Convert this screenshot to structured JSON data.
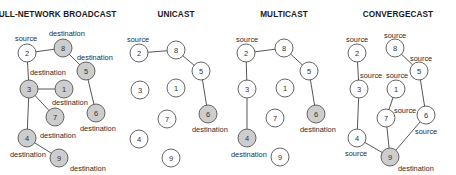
{
  "colors": {
    "node_fill": "#ffffff",
    "node_fill_highlight": "#cdcdcd",
    "node_stroke": "#555555",
    "edge": "#444444"
  },
  "panels": [
    {
      "title": "FULL-NETWORK BROADCAST",
      "title_x": 55,
      "nodes": [
        {
          "id": "2",
          "x": 27,
          "y": 53,
          "highlight": false,
          "label": "source",
          "lx": 15,
          "ly": 41
        },
        {
          "id": "8",
          "x": 63,
          "y": 48,
          "highlight": true,
          "label": "destination",
          "lx": 49,
          "ly": 36
        },
        {
          "id": "5",
          "x": 86,
          "y": 71,
          "highlight": true,
          "label": "destination",
          "lx": 77,
          "ly": 60
        },
        {
          "id": "3",
          "x": 29,
          "y": 89,
          "highlight": true,
          "label": "destination",
          "lx": 30,
          "ly": 75
        },
        {
          "id": "1",
          "x": 64,
          "y": 89,
          "highlight": true,
          "label": "destination",
          "lx": 52,
          "ly": 105
        },
        {
          "id": "7",
          "x": 55,
          "y": 117,
          "highlight": true,
          "label": "destination",
          "lx": 40,
          "ly": 138
        },
        {
          "id": "6",
          "x": 96,
          "y": 113,
          "highlight": true,
          "label": "destination",
          "lx": 80,
          "ly": 131
        },
        {
          "id": "4",
          "x": 27,
          "y": 138,
          "highlight": true,
          "label": "destination",
          "lx": 10,
          "ly": 157
        },
        {
          "id": "9",
          "x": 59,
          "y": 158,
          "highlight": true,
          "label": "destination",
          "lx": 70,
          "ly": 171
        }
      ],
      "edges": [
        [
          "2",
          "8"
        ],
        [
          "8",
          "5"
        ],
        [
          "5",
          "6"
        ],
        [
          "2",
          "3"
        ],
        [
          "3",
          "1"
        ],
        [
          "3",
          "7"
        ],
        [
          "3",
          "4"
        ],
        [
          "4",
          "9"
        ]
      ]
    },
    {
      "title": "UNICAST",
      "title_x": 176,
      "nodes": [
        {
          "id": "2",
          "x": 139,
          "y": 53,
          "highlight": false,
          "label": "source",
          "lx": 127,
          "ly": 42
        },
        {
          "id": "8",
          "x": 176,
          "y": 50,
          "highlight": false,
          "label": "",
          "lx": 0,
          "ly": 0
        },
        {
          "id": "5",
          "x": 201,
          "y": 71,
          "highlight": false,
          "label": "",
          "lx": 0,
          "ly": 0
        },
        {
          "id": "3",
          "x": 140,
          "y": 90,
          "highlight": false,
          "label": "",
          "lx": 0,
          "ly": 0
        },
        {
          "id": "1",
          "x": 176,
          "y": 88,
          "highlight": false,
          "label": "",
          "lx": 0,
          "ly": 0
        },
        {
          "id": "7",
          "x": 167,
          "y": 119,
          "highlight": false,
          "label": "",
          "lx": 0,
          "ly": 0
        },
        {
          "id": "6",
          "x": 208,
          "y": 114,
          "highlight": true,
          "label": "destination",
          "lx": 192,
          "ly": 132
        },
        {
          "id": "4",
          "x": 139,
          "y": 139,
          "highlight": false,
          "label": "",
          "lx": 0,
          "ly": 0
        },
        {
          "id": "9",
          "x": 171,
          "y": 158,
          "highlight": false,
          "label": "",
          "lx": 0,
          "ly": 0
        }
      ],
      "edges": [
        [
          "2",
          "8"
        ],
        [
          "8",
          "5"
        ],
        [
          "5",
          "6"
        ]
      ]
    },
    {
      "title": "MULTICAST",
      "title_x": 284,
      "nodes": [
        {
          "id": "2",
          "x": 246,
          "y": 53,
          "highlight": false,
          "label": "source",
          "lx": 236,
          "ly": 42
        },
        {
          "id": "8",
          "x": 284,
          "y": 48,
          "highlight": false,
          "label": "",
          "lx": 0,
          "ly": 0
        },
        {
          "id": "5",
          "x": 309,
          "y": 71,
          "highlight": false,
          "label": "",
          "lx": 0,
          "ly": 0
        },
        {
          "id": "3",
          "x": 247,
          "y": 89,
          "highlight": false,
          "label": "",
          "lx": 0,
          "ly": 0
        },
        {
          "id": "1",
          "x": 285,
          "y": 88,
          "highlight": false,
          "label": "",
          "lx": 0,
          "ly": 0
        },
        {
          "id": "7",
          "x": 275,
          "y": 118,
          "highlight": false,
          "label": "",
          "lx": 0,
          "ly": 0
        },
        {
          "id": "6",
          "x": 316,
          "y": 114,
          "highlight": true,
          "label": "destination",
          "lx": 300,
          "ly": 132
        },
        {
          "id": "4",
          "x": 247,
          "y": 138,
          "highlight": true,
          "label": "destination",
          "lx": 231,
          "ly": 157
        },
        {
          "id": "9",
          "x": 280,
          "y": 157,
          "highlight": false,
          "label": "",
          "lx": 0,
          "ly": 0
        }
      ],
      "edges": [
        [
          "2",
          "8"
        ],
        [
          "8",
          "5"
        ],
        [
          "5",
          "6"
        ],
        [
          "2",
          "3"
        ],
        [
          "3",
          "4"
        ]
      ]
    },
    {
      "title": "CONVERGECAST",
      "title_x": 398,
      "nodes": [
        {
          "id": "2",
          "x": 357,
          "y": 53,
          "highlight": false,
          "label": "source",
          "lx": 346,
          "ly": 42
        },
        {
          "id": "8",
          "x": 395,
          "y": 48,
          "highlight": false,
          "label": "source",
          "lx": 384,
          "ly": 38
        },
        {
          "id": "5",
          "x": 419,
          "y": 71,
          "highlight": false,
          "label": "source",
          "lx": 410,
          "ly": 61
        },
        {
          "id": "3",
          "x": 359,
          "y": 89,
          "highlight": false,
          "label": "source",
          "lx": 360,
          "ly": 78
        },
        {
          "id": "1",
          "x": 396,
          "y": 89,
          "highlight": false,
          "label": "source",
          "lx": 386,
          "ly": 78
        },
        {
          "id": "7",
          "x": 386,
          "y": 118,
          "highlight": false,
          "label": "source",
          "lx": 394,
          "ly": 113
        },
        {
          "id": "6",
          "x": 426,
          "y": 115,
          "highlight": false,
          "label": "source",
          "lx": 415,
          "ly": 134
        },
        {
          "id": "4",
          "x": 357,
          "y": 138,
          "highlight": false,
          "label": "source",
          "lx": 345,
          "ly": 156
        },
        {
          "id": "9",
          "x": 390,
          "y": 157,
          "highlight": true,
          "label": "destination",
          "lx": 398,
          "ly": 171
        }
      ],
      "edges": [
        [
          "2",
          "3"
        ],
        [
          "3",
          "4"
        ],
        [
          "4",
          "9"
        ],
        [
          "1",
          "7"
        ],
        [
          "7",
          "9"
        ],
        [
          "8",
          "5"
        ],
        [
          "5",
          "6"
        ],
        [
          "6",
          "9"
        ]
      ]
    }
  ]
}
